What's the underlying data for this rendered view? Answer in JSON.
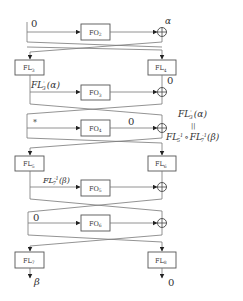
{
  "diagram": {
    "type": "feistel-network",
    "rounds": [
      {
        "fo": {
          "name": "FO",
          "index": "2"
        },
        "left_input_label": "0",
        "xor_output_label": "α"
      },
      {
        "fo": {
          "name": "FO",
          "index": "3"
        },
        "left_input_label": "FL'3(α)",
        "xor_output_label": "0"
      },
      {
        "fo": {
          "name": "FO",
          "index": "4"
        },
        "left_input_label": "*",
        "fo_output_label": "0"
      },
      {
        "fo": {
          "name": "FO",
          "index": "5"
        },
        "left_input_label": "FL7^-1(β)"
      },
      {
        "fo": {
          "name": "FO",
          "index": "6"
        },
        "left_input_label": "0"
      }
    ],
    "fl_layers": [
      {
        "left": {
          "name": "FL",
          "index": "3"
        },
        "right": {
          "name": "FL",
          "index": "4"
        }
      },
      {
        "left": {
          "name": "FL",
          "index": "5"
        },
        "right": {
          "name": "FL",
          "index": "6"
        }
      },
      {
        "left": {
          "name": "FL",
          "index": "7"
        },
        "right": {
          "name": "FL",
          "index": "8"
        }
      }
    ],
    "labels": {
      "top_left_input": "0",
      "alpha": "α",
      "round2_left": {
        "base": "FL",
        "sup": "'",
        "sub": "3",
        "arg": "(α)"
      },
      "round2_right_zero": "0",
      "round3_star": "*",
      "round3_fo_out": "0",
      "annotation_top": {
        "base": "FL",
        "sup": "'",
        "sub": "3",
        "arg": "(α)"
      },
      "annotation_equals": "||",
      "annotation_bottom_a": {
        "base": "FL",
        "sup": "-1",
        "sub": "5"
      },
      "annotation_compose": "∘",
      "annotation_bottom_b": {
        "base": "FL",
        "sup": "-1",
        "sub": "7",
        "arg": "(β)"
      },
      "round4_left": {
        "base": "FL",
        "sup": "-1",
        "sub": "7",
        "arg": "(β)"
      },
      "round5_left": "0",
      "output_left": "β",
      "output_right": "0"
    },
    "xor_symbol": "⊕"
  }
}
